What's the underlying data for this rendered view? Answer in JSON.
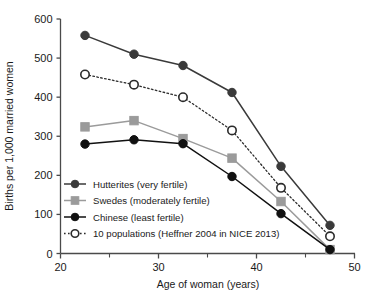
{
  "chart_data": {
    "type": "line",
    "title": "",
    "xlabel": "Age of woman (years)",
    "ylabel": "Births per 1,000 married women",
    "xlim": [
      20,
      50
    ],
    "ylim": [
      0,
      600
    ],
    "xticks": [
      20,
      30,
      40,
      50
    ],
    "xticks_minor": [
      25,
      35,
      45
    ],
    "yticks": [
      0,
      100,
      200,
      300,
      400,
      500,
      600
    ],
    "xtick_labels": [
      "20",
      "30",
      "40",
      "50"
    ],
    "ytick_labels": [
      "0",
      "100",
      "200",
      "300",
      "400",
      "500",
      "600"
    ],
    "grid": false,
    "legend_position": "lower-left",
    "x": [
      22.5,
      27.5,
      32.5,
      37.5,
      42.5,
      47.5
    ],
    "series": [
      {
        "name": "Hutterites (very fertile)",
        "values": [
          558,
          510,
          481,
          412,
          223,
          72
        ],
        "color": "#3a3a3a",
        "marker": "filled-circle",
        "line": "solid"
      },
      {
        "name": "Swedes (moderately fertile)",
        "values": [
          324,
          340,
          294,
          244,
          133,
          10
        ],
        "color": "#9b9b9b",
        "marker": "filled-square",
        "line": "solid"
      },
      {
        "name": "Chinese (least fertile)",
        "values": [
          280,
          291,
          281,
          197,
          102,
          10
        ],
        "color": "#111111",
        "marker": "filled-circle",
        "line": "solid"
      },
      {
        "name": "10 populations (Heffner 2004 in NICE 2013)",
        "values": [
          458,
          432,
          400,
          315,
          168,
          44
        ],
        "color": "#2b2b2b",
        "marker": "open-circle",
        "line": "dotted"
      }
    ]
  },
  "axes": {
    "x_title": "Age of woman (years)",
    "y_title": "Births per 1,000 married women"
  },
  "legend": {
    "items": [
      {
        "label": "Hutterites (very fertile)"
      },
      {
        "label": "Swedes (moderately fertile)"
      },
      {
        "label": "Chinese (least fertile)"
      },
      {
        "label": "10 populations (Heffner 2004 in NICE 2013)"
      }
    ]
  }
}
